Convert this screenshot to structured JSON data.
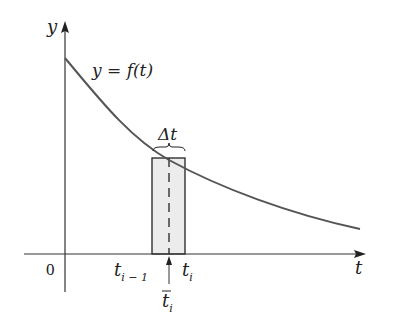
{
  "diagram": {
    "type": "riemann-rectangle",
    "colors": {
      "axis": "#333333",
      "curve": "#555555",
      "rect_fill": "#ececec",
      "rect_stroke": "#222222",
      "text": "#222222"
    },
    "labels": {
      "y_axis": "y",
      "t_axis": "t",
      "origin": "0",
      "curve": "y = f(t)",
      "delta": "Δt",
      "t_prev": "t",
      "t_prev_sub": "i − 1",
      "t_curr": "t",
      "t_curr_sub": "i",
      "t_bar": "t",
      "t_bar_sub": "i"
    }
  }
}
